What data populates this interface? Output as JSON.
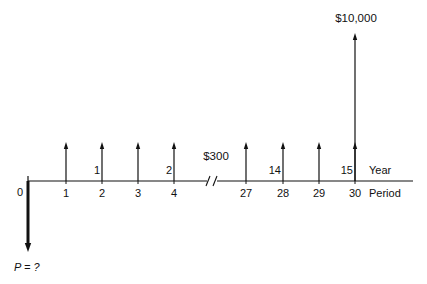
{
  "diagram": {
    "type": "cash-flow-diagram",
    "axis": {
      "y": 181,
      "x_start": 28,
      "x_end": 413,
      "color": "#111111"
    },
    "break_mark": {
      "x": 212
    },
    "origin": {
      "label": "0",
      "x": 28
    },
    "present_value": {
      "label": "P = ?",
      "arrow_x": 28,
      "arrow_bottom_y": 252
    },
    "receipts_label": "$300",
    "receipts_label_pos": {
      "x": 216,
      "y": 152
    },
    "final_payment": {
      "label": "$10,000",
      "period": "30",
      "x": 355,
      "top_y": 33
    },
    "periods": [
      {
        "label": "1",
        "x": 66,
        "arrow": true
      },
      {
        "label": "2",
        "x": 102,
        "arrow": true,
        "year": "1"
      },
      {
        "label": "3",
        "x": 138,
        "arrow": true
      },
      {
        "label": "4",
        "x": 174,
        "arrow": true,
        "year": "2"
      },
      {
        "label": "27",
        "x": 246,
        "arrow": true
      },
      {
        "label": "28",
        "x": 283,
        "arrow": true,
        "year": "14"
      },
      {
        "label": "29",
        "x": 319,
        "arrow": true
      },
      {
        "label": "30",
        "x": 355,
        "arrow": true,
        "year": "15"
      }
    ],
    "arrow_top_y": 142,
    "row_labels": {
      "year": "Year",
      "period": "Period"
    }
  }
}
